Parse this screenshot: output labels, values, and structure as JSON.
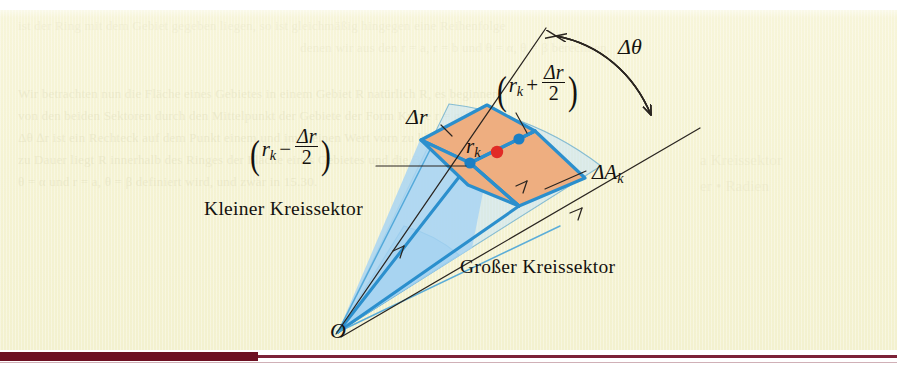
{
  "page": {
    "background_color": "#f5f3d3",
    "paper_color": "#f7f5d9",
    "rule_color": "#6d1022"
  },
  "figure": {
    "caption_language": "German",
    "origin_label": "O",
    "sector_labels": {
      "small": "Kleiner Kreissektor",
      "large": "Großer Kreissektor"
    },
    "math_labels": {
      "delta_theta": "Δθ",
      "delta_r": "Δr",
      "r_k": "r",
      "r_k_sub": "k",
      "delta_a_k": "ΔA",
      "delta_a_k_sub": "k",
      "outer_radius_open": "(",
      "outer_radius_close": ")",
      "outer_radius_lead": "r",
      "outer_radius_sub": "k",
      "outer_radius_op": "+",
      "inner_radius_op": "−",
      "frac_num": "Δr",
      "frac_den": "2"
    },
    "colors": {
      "sector_fill": "#a9d5f2",
      "sector_fill_light": "#c7e4f7",
      "sector_edge": "#2b8fcd",
      "patch_fill": "#eeae80",
      "patch_edge": "#2b8fcd",
      "center_dot": "#e12b26",
      "node_dot": "#1b7fc4",
      "leader_line": "#2a2520",
      "text": "#14120f"
    }
  },
  "ghost_text": {
    "lines": [
      {
        "text": "ist der Ring mit dem Gebiet gegeben liegen, so ist gleichmäßig hingegen eine Reihenfolge",
        "x": 18,
        "y": 18,
        "size": 13,
        "class": "vfaint"
      },
      {
        "text": "denen wir aus den r = a, r = b und θ = α, θ = β berechnen.",
        "x": 300,
        "y": 40,
        "size": 13,
        "class": "vfaint"
      },
      {
        "text": "Wir betrachten nun die Fläche eines Gebietes in einem Gebiet R natürlich R, es beginnen",
        "x": 18,
        "y": 86,
        "size": 13,
        "class": "faint"
      },
      {
        "text": "von den beiden Sektoren durch den Mittelpunkt der Gebiete der Form Kurve r = g(θ) und",
        "x": 18,
        "y": 108,
        "size": 13,
        "class": "faint"
      },
      {
        "text": "Δθ ∆r ist ein Rechteck auf dem Punkt einem und im kleinen Wert vorn zu kleinen a und",
        "x": 18,
        "y": 130,
        "size": 13,
        "class": "faint"
      },
      {
        "text": "zu Dauer liegt R innerhalb des Ringes der Fläche eines Gebietes und die Berechnung",
        "x": 18,
        "y": 152,
        "size": 13,
        "class": "faint"
      },
      {
        "text": "θ = α und r = a, θ = β definiert wird, und zwar in 15.30.",
        "x": 18,
        "y": 174,
        "size": 13,
        "class": "faint"
      },
      {
        "text": "a Kreissektor",
        "x": 700,
        "y": 152,
        "size": 15,
        "class": "vfaint"
      },
      {
        "text": "er • Radien",
        "x": 700,
        "y": 178,
        "size": 15,
        "class": "vfaint"
      }
    ]
  }
}
